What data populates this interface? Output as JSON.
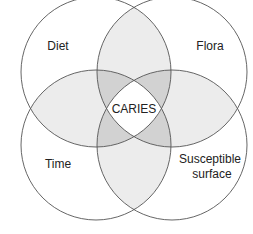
{
  "diagram": {
    "type": "venn",
    "title": "",
    "center_label": "CARIES",
    "circles": [
      {
        "id": "diet",
        "label": "Diet",
        "label_lines": [
          "Diet"
        ],
        "cx": 96,
        "cy": 72,
        "r": 75
      },
      {
        "id": "flora",
        "label": "Flora",
        "label_lines": [
          "Flora"
        ],
        "cx": 172,
        "cy": 72,
        "r": 75
      },
      {
        "id": "time",
        "label": "Time",
        "label_lines": [
          "Time"
        ],
        "cx": 96,
        "cy": 145,
        "r": 75
      },
      {
        "id": "susceptible-surface",
        "label": "Susceptible surface",
        "label_lines": [
          "Susceptible",
          "surface"
        ],
        "cx": 172,
        "cy": 145,
        "r": 75
      }
    ],
    "shading": {
      "one_circle": "#ffffff",
      "two_overlap": "#ececec",
      "three_overlap": "#d2d2d2",
      "four_overlap": "#ffffff"
    },
    "stroke_color": "#555555"
  }
}
